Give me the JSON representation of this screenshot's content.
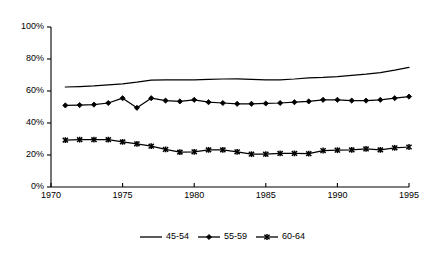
{
  "chart_data": {
    "type": "line",
    "title": "",
    "xlabel": "",
    "ylabel": "",
    "xlim": [
      1970,
      1995
    ],
    "ylim": [
      0,
      100
    ],
    "grid": false,
    "legend_position": "bottom",
    "x_ticks": [
      "1970",
      "1975",
      "1980",
      "1985",
      "1990",
      "1995"
    ],
    "x_tick_values": [
      1970,
      1975,
      1980,
      1985,
      1990,
      1995
    ],
    "y_ticks": [
      "0%",
      "20%",
      "40%",
      "60%",
      "80%",
      "100%"
    ],
    "y_tick_values": [
      0,
      20,
      40,
      60,
      80,
      100
    ],
    "x": [
      1971,
      1972,
      1973,
      1974,
      1975,
      1976,
      1977,
      1978,
      1979,
      1980,
      1981,
      1982,
      1983,
      1984,
      1985,
      1986,
      1987,
      1988,
      1989,
      1990,
      1991,
      1992,
      1993,
      1994,
      1995
    ],
    "series": [
      {
        "name": "45-54",
        "marker": "none",
        "values": [
          62.5,
          62.8,
          63.2,
          63.8,
          64.5,
          65.5,
          66.8,
          67.0,
          67.0,
          67.0,
          67.2,
          67.5,
          67.6,
          67.3,
          67.0,
          67.0,
          67.5,
          68.2,
          68.5,
          69.0,
          69.8,
          70.5,
          71.5,
          73.0,
          74.8
        ]
      },
      {
        "name": "55-59",
        "marker": "diamond",
        "values": [
          51.0,
          51.2,
          51.5,
          52.5,
          55.5,
          49.5,
          55.5,
          54.0,
          53.5,
          54.5,
          53.0,
          52.5,
          52.0,
          52.0,
          52.2,
          52.5,
          53.0,
          53.5,
          54.5,
          54.5,
          54.0,
          54.0,
          54.5,
          55.5,
          56.5
        ]
      },
      {
        "name": "60-64",
        "marker": "star",
        "values": [
          29.3,
          29.6,
          29.6,
          29.6,
          28.2,
          27.0,
          25.5,
          23.5,
          21.8,
          22.0,
          23.2,
          23.2,
          22.0,
          20.5,
          20.5,
          21.0,
          21.0,
          20.8,
          22.8,
          23.0,
          23.2,
          23.8,
          23.2,
          24.5,
          25.0
        ]
      }
    ]
  },
  "legend": {
    "items": [
      {
        "label": "45-54",
        "marker": "none"
      },
      {
        "label": "55-59",
        "marker": "diamond"
      },
      {
        "label": "60-64",
        "marker": "star"
      }
    ]
  }
}
